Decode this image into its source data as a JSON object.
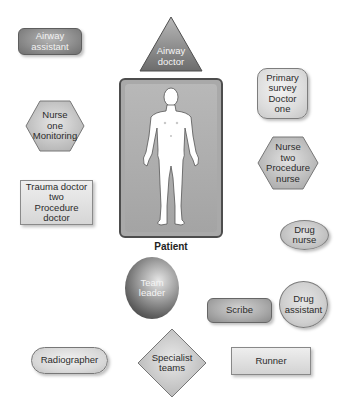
{
  "diagram": {
    "type": "trauma team positions around patient",
    "colors": {
      "dark_fill": "#8f8f8f",
      "light_fill": "#dcdcdc",
      "patient_box": "#a9a9a9",
      "border": "#4d4d4d"
    },
    "patient": {
      "label": "Patient",
      "icon": "human-body-icon"
    },
    "roles": {
      "airway_assistant": {
        "lines": [
          "Airway",
          "assistant"
        ],
        "shape": "rounded-rectangle"
      },
      "airway_doctor": {
        "lines": [
          "Airway",
          "doctor"
        ],
        "shape": "triangle"
      },
      "primary_survey": {
        "lines": [
          "Primary",
          "survey",
          "Doctor",
          "one"
        ],
        "shape": "rounded-square"
      },
      "nurse_one": {
        "lines": [
          "Nurse",
          "one",
          "Monitoring"
        ],
        "shape": "hexagon"
      },
      "nurse_two": {
        "lines": [
          "Nurse",
          "two",
          "Procedure",
          "nurse"
        ],
        "shape": "hexagon"
      },
      "trauma_doctor": {
        "lines": [
          "Trauma doctor",
          "two",
          "Procedure doctor"
        ],
        "shape": "rectangle"
      },
      "drug_nurse": {
        "lines": [
          "Drug",
          "nurse"
        ],
        "shape": "ellipse"
      },
      "team_leader": {
        "lines": [
          "Team",
          "leader"
        ],
        "shape": "sphere"
      },
      "scribe": {
        "lines": [
          "Scribe"
        ],
        "shape": "rounded-rectangle"
      },
      "drug_assistant": {
        "lines": [
          "Drug",
          "assistant"
        ],
        "shape": "circle"
      },
      "radiographer": {
        "lines": [
          "Radiographer"
        ],
        "shape": "pill"
      },
      "specialist_teams": {
        "lines": [
          "Specialist",
          "teams"
        ],
        "shape": "diamond"
      },
      "runner": {
        "lines": [
          "Runner"
        ],
        "shape": "rectangle"
      }
    }
  }
}
